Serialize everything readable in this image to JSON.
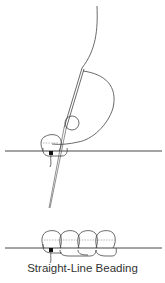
{
  "diagram": {
    "caption": "Straight-Line Beading",
    "colors": {
      "line": "#444444",
      "dotted": "#888888",
      "knot": "#111111",
      "caption": "#333333"
    },
    "figures": [
      {
        "id": "step-1",
        "description": "Needle with thread passing through a bead, stitching one bead onto a baseline fabric",
        "beads": 2
      },
      {
        "id": "step-2",
        "description": "Four beads stitched in a straight line on the baseline",
        "beads": 4
      }
    ]
  }
}
